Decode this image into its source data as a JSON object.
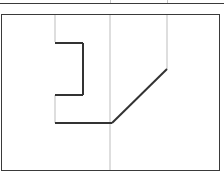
{
  "panel": {
    "title": "",
    "background_color": "#ffffff",
    "border_color": "#3a3a3a",
    "gridline_color": "#d0d0d0",
    "stroke_color": "#333333"
  },
  "top_strip": {
    "divider_x_positions": [
      110,
      167
    ]
  },
  "grid": {
    "vertical_lines": [
      {
        "x": 55,
        "y1": 15,
        "y2": 42
      },
      {
        "x": 55,
        "y1": 95,
        "y2": 123
      },
      {
        "x": 110,
        "y1": 15,
        "y2": 170
      },
      {
        "x": 167,
        "y1": 15,
        "y2": 69
      }
    ]
  },
  "drawing": {
    "type": "polyline-sketch",
    "segments": [
      {
        "name": "notch-top",
        "x1": 55,
        "y1": 43,
        "x2": 83,
        "y2": 43
      },
      {
        "name": "notch-right",
        "x1": 83,
        "y1": 43,
        "x2": 83,
        "y2": 95
      },
      {
        "name": "notch-bottom",
        "x1": 83,
        "y1": 95,
        "x2": 55,
        "y2": 95
      },
      {
        "name": "base-horizontal",
        "x1": 55,
        "y1": 123,
        "x2": 112,
        "y2": 123
      },
      {
        "name": "diagonal",
        "x1": 112,
        "y1": 123,
        "x2": 167,
        "y2": 69
      }
    ]
  }
}
